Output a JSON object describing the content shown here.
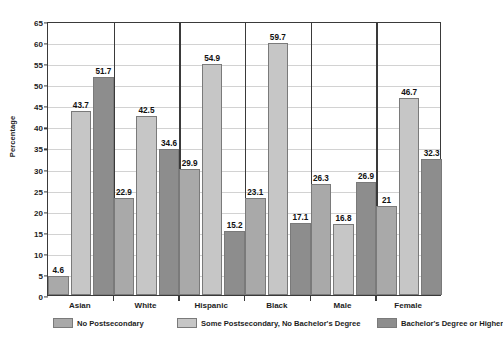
{
  "chart_data": {
    "type": "bar",
    "title": "",
    "xlabel": "",
    "ylabel": "Percentage",
    "ylim": [
      0,
      65
    ],
    "ytick_step": 5,
    "yticks": [
      "0",
      "5",
      "10",
      "15",
      "20",
      "25",
      "30",
      "35",
      "40",
      "45",
      "50",
      "55",
      "60",
      "65"
    ],
    "grid": true,
    "legend_position": "bottom",
    "categories": [
      "Asian",
      "White",
      "Hispanic",
      "Black",
      "Male",
      "Female"
    ],
    "series": [
      {
        "name": "No Postsecondary",
        "color": "#a9a9a9",
        "values": [
          4.6,
          22.9,
          29.9,
          23.1,
          26.3,
          21
        ],
        "labels": [
          "4.6",
          "22.9",
          "29.9",
          "23.1",
          "26.3",
          "21"
        ]
      },
      {
        "name": "Some Postsecondary, No Bachelor's Degree",
        "color": "#c6c6c6",
        "values": [
          43.7,
          42.5,
          54.9,
          59.7,
          16.8,
          46.7
        ],
        "labels": [
          "43.7",
          "42.5",
          "54.9",
          "59.7",
          "16.8",
          "46.7"
        ]
      },
      {
        "name": "Bachelor's Degree or Higher",
        "color": "#8d8d8d",
        "values": [
          51.7,
          34.6,
          15.2,
          17.1,
          26.9,
          32.3
        ],
        "labels": [
          "51.7",
          "34.6",
          "15.2",
          "17.1",
          "26.9",
          "32.3"
        ]
      }
    ]
  },
  "colors": {
    "series_1": "#a9a9a9",
    "series_2": "#c6c6c6",
    "series_3": "#8d8d8d",
    "axis": "#3a3a3a",
    "grid": "#d2d2d2",
    "text": "#1d1d1d",
    "background": "#ffffff"
  }
}
